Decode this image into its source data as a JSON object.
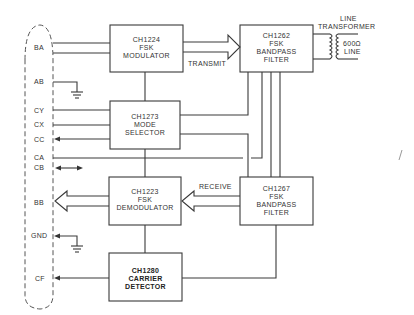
{
  "diagram": {
    "connector_pins": [
      {
        "id": "BA",
        "label": "BA"
      },
      {
        "id": "AB",
        "label": "AB"
      },
      {
        "id": "CY",
        "label": "CY"
      },
      {
        "id": "CX",
        "label": "CX"
      },
      {
        "id": "CC",
        "label": "CC"
      },
      {
        "id": "CA",
        "label": "CA"
      },
      {
        "id": "CB",
        "label": "CB"
      },
      {
        "id": "BB",
        "label": "BB"
      },
      {
        "id": "GND",
        "label": "GND"
      },
      {
        "id": "CF",
        "label": "CF"
      }
    ],
    "blocks": {
      "modulator": {
        "line1": "CH1224",
        "line2": "FSK",
        "line3": "MODULATOR"
      },
      "mode_selector": {
        "line1": "CH1273",
        "line2": "MODE",
        "line3": "SELECTOR"
      },
      "demodulator": {
        "line1": "CH1223",
        "line2": "FSK",
        "line3": "DEMODULATOR"
      },
      "carrier_detector": {
        "line1": "CH1280",
        "line2": "CARRIER",
        "line3": "DETECTOR"
      },
      "tx_filter": {
        "line1": "CH1262",
        "line2": "FSK",
        "line3": "BANDPASS",
        "line4": "FILTER"
      },
      "rx_filter": {
        "line1": "CH1267",
        "line2": "FSK",
        "line3": "BANDPASS",
        "line4": "FILTER"
      }
    },
    "signal_labels": {
      "transmit": "TRANSMIT",
      "receive": "RECEIVE"
    },
    "transformer": {
      "title_line1": "LINE",
      "title_line2": "TRANSFORMER",
      "line_label1": "600Ω",
      "line_label2": "LINE"
    }
  }
}
